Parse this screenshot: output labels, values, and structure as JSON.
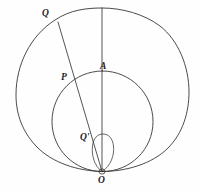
{
  "figure": {
    "background_color": "#fefefe",
    "ink_color": "#3a3632",
    "width": 200,
    "height": 194
  },
  "labels": {
    "Q": "Q",
    "A": "A",
    "P": "P",
    "Q_prime": "Q'",
    "O": "O"
  },
  "geometry": {
    "pole": {
      "x": 102,
      "y": 171.5
    },
    "outer_curve": {
      "name": "outer-limacon",
      "top_y": 8,
      "left_x": 16,
      "right_x": 189,
      "center_x": 102.5,
      "max_radius": 86
    },
    "inner_circle": {
      "name": "generating-circle",
      "center_x": 102.5,
      "center_y": 121.5,
      "radius": 50.5,
      "top_y": 71,
      "left_x": 52,
      "right_x": 153
    },
    "inner_loop": {
      "name": "inner-loop",
      "apex_y": 134,
      "half_width": 11,
      "center_x": 103
    },
    "axis_line": {
      "x1": 102,
      "y1": 8,
      "x2": 102,
      "y2": 171.5
    },
    "ray_line": {
      "x1": 58,
      "y1": 22,
      "x2": 102,
      "y2": 171.5
    },
    "points": {
      "Q": {
        "x": 58,
        "y": 22
      },
      "P": {
        "x": 78,
        "y": 77
      },
      "A": {
        "x": 102,
        "y": 71
      },
      "Q_prime": {
        "x": 95,
        "y": 145
      },
      "O": {
        "x": 102,
        "y": 171.5
      }
    }
  }
}
